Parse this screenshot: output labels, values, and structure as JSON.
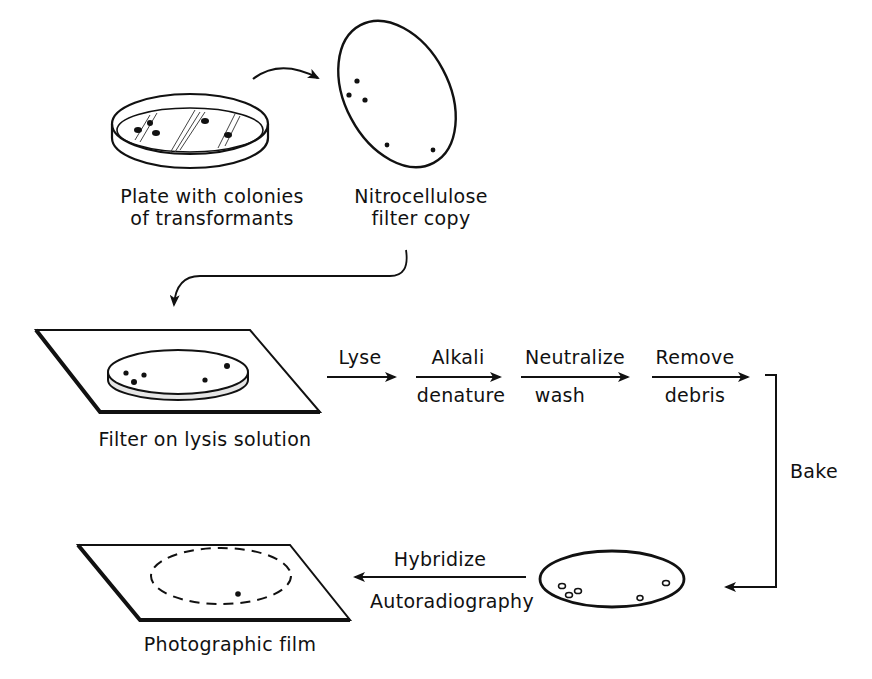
{
  "diagram": {
    "nodes": {
      "plate": {
        "caption_line1": "Plate with colonies",
        "caption_line2": "of transformants"
      },
      "filter_copy": {
        "caption_line1": "Nitrocellulose",
        "caption_line2": "filter copy"
      },
      "lysis": {
        "caption": "Filter on lysis solution"
      },
      "film": {
        "caption": "Photographic film"
      },
      "baked_filter": {
        "caption": ""
      }
    },
    "steps": [
      {
        "top": "Lyse",
        "bottom": ""
      },
      {
        "top": "Alkali",
        "bottom": "denature"
      },
      {
        "top": "Neutralize",
        "bottom": "wash"
      },
      {
        "top": "Remove",
        "bottom": "debris"
      }
    ],
    "bake_label": "Bake",
    "final_step": {
      "top": "Hybridize",
      "bottom": "Autoradiography"
    },
    "colors": {
      "ink": "#111111",
      "background": "#ffffff"
    }
  }
}
